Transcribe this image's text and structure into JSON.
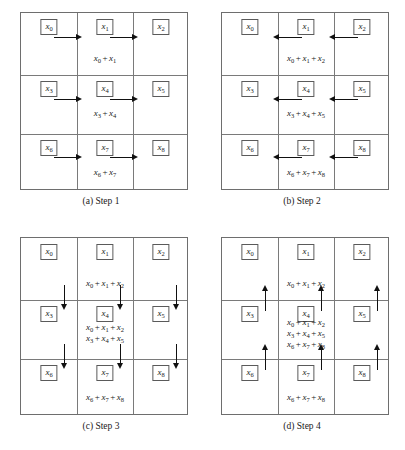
{
  "figure": {
    "caption": "",
    "panels": [
      {
        "id": "a",
        "caption": "(a) Step 1",
        "arrows": {
          "direction": "right",
          "count": 6
        },
        "cells": [
          {
            "label": "x₀",
            "formula": ""
          },
          {
            "label": "x₁",
            "formula": "x₀ + x₁"
          },
          {
            "label": "x₂",
            "formula": ""
          },
          {
            "label": "x₃",
            "formula": ""
          },
          {
            "label": "x₄",
            "formula": "x₃ + x₄"
          },
          {
            "label": "x₅",
            "formula": ""
          },
          {
            "label": "x₆",
            "formula": ""
          },
          {
            "label": "x₇",
            "formula": "x₆ + x₇"
          },
          {
            "label": "x₈",
            "formula": ""
          }
        ]
      },
      {
        "id": "b",
        "caption": "(b) Step 2",
        "arrows": {
          "direction": "left",
          "count": 6
        },
        "cells": [
          {
            "label": "x₀",
            "formula": ""
          },
          {
            "label": "x₁",
            "formula": "x₀ + x₁ + x₂"
          },
          {
            "label": "x₂",
            "formula": ""
          },
          {
            "label": "x₃",
            "formula": ""
          },
          {
            "label": "x₄",
            "formula": "x₃ + x₄ + x₅"
          },
          {
            "label": "x₅",
            "formula": ""
          },
          {
            "label": "x₆",
            "formula": ""
          },
          {
            "label": "x₇",
            "formula": "x₆ + x₇ + x₈"
          },
          {
            "label": "x₈",
            "formula": ""
          }
        ]
      },
      {
        "id": "c",
        "caption": "(c) Step 3",
        "arrows": {
          "direction": "down",
          "count": 6
        },
        "cells": [
          {
            "label": "x₀",
            "formula": ""
          },
          {
            "label": "x₁",
            "formula": "x₀ + x₁ + x₂"
          },
          {
            "label": "x₂",
            "formula": ""
          },
          {
            "label": "x₃",
            "formula": ""
          },
          {
            "label": "x₄",
            "formula": "x₀ + x₁ + x₂ / x₃ + x₄ + x₅"
          },
          {
            "label": "x₅",
            "formula": ""
          },
          {
            "label": "x₆",
            "formula": ""
          },
          {
            "label": "x₇",
            "formula": "x₆ + x₇ + x₈"
          },
          {
            "label": "x₈",
            "formula": ""
          }
        ]
      },
      {
        "id": "d",
        "caption": "(d) Step 4",
        "arrows": {
          "direction": "up",
          "count": 6
        },
        "cells": [
          {
            "label": "x₀",
            "formula": ""
          },
          {
            "label": "x₁",
            "formula": "x₀ + x₁ + x₂"
          },
          {
            "label": "x₂",
            "formula": ""
          },
          {
            "label": "x₃",
            "formula": ""
          },
          {
            "label": "x₄",
            "formula": "x₀ + x₁ + x₂ / x₃ + x₄ + x₅ / x₆ + x₇ + x₈"
          },
          {
            "label": "x₅",
            "formula": ""
          },
          {
            "label": "x₆",
            "formula": ""
          },
          {
            "label": "x₇",
            "formula": "x₆ + x₇ + x₈"
          },
          {
            "label": "x₈",
            "formula": ""
          }
        ]
      }
    ]
  },
  "labels": {
    "x0": "x",
    "x0s": "0",
    "x1": "x",
    "x1s": "1",
    "x2": "x",
    "x2s": "2",
    "x3": "x",
    "x3s": "3",
    "x4": "x",
    "x4s": "4",
    "x5": "x",
    "x5s": "5",
    "x6": "x",
    "x6s": "6",
    "x7": "x",
    "x7s": "7",
    "x8": "x",
    "x8s": "8"
  },
  "formulas": {
    "sum_0_1": [
      [
        "x",
        "0"
      ],
      [
        "x",
        "1"
      ]
    ],
    "sum_3_4": [
      [
        "x",
        "3"
      ],
      [
        "x",
        "4"
      ]
    ],
    "sum_6_7": [
      [
        "x",
        "6"
      ],
      [
        "x",
        "7"
      ]
    ],
    "sum_0_1_2": [
      [
        "x",
        "0"
      ],
      [
        "x",
        "1"
      ],
      [
        "x",
        "2"
      ]
    ],
    "sum_3_4_5": [
      [
        "x",
        "3"
      ],
      [
        "x",
        "4"
      ],
      [
        "x",
        "5"
      ]
    ],
    "sum_6_7_8": [
      [
        "x",
        "6"
      ],
      [
        "x",
        "7"
      ],
      [
        "x",
        "8"
      ]
    ]
  },
  "captions": {
    "a": "(a) Step 1",
    "b": "(b) Step 2",
    "c": "(c) Step 3",
    "d": "(d) Step 4"
  },
  "colors": {
    "grid_line": "#7a7a7a",
    "box_border": "#5a5a5a",
    "arrow": "#111111",
    "text": "#1a1a1a",
    "background": "#ffffff"
  }
}
